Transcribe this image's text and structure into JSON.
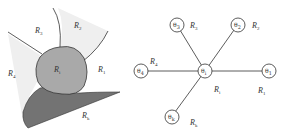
{
  "left_panel": {
    "regions": [
      {
        "id": "R1_center",
        "main": "R",
        "sub": "i",
        "fill": "#a9a9a9"
      },
      {
        "id": "R1",
        "main": "R",
        "sub": "1",
        "fill": "#ffffff"
      },
      {
        "id": "R2",
        "main": "R",
        "sub": "2",
        "fill": "#efefef"
      },
      {
        "id": "R3",
        "main": "R",
        "sub": "3",
        "fill": "#ffffff"
      },
      {
        "id": "R4",
        "main": "R",
        "sub": "4",
        "fill": "#efefef"
      },
      {
        "id": "Rk",
        "main": "R",
        "sub": "k",
        "fill": "#737373"
      }
    ]
  },
  "right_panel": {
    "center": {
      "main": "θ",
      "sub": "i",
      "label_main": "R",
      "label_sub": "i"
    },
    "nodes": [
      {
        "main": "θ",
        "sub": "3",
        "label_main": "R",
        "label_sub": "3"
      },
      {
        "main": "θ",
        "sub": "2",
        "label_main": "R",
        "label_sub": "2"
      },
      {
        "main": "θ",
        "sub": "4",
        "label_main": "R",
        "label_sub": "4"
      },
      {
        "main": "θ",
        "sub": "1",
        "label_main": "R",
        "label_sub": "1"
      },
      {
        "main": "θ",
        "sub": "k",
        "label_main": "R",
        "label_sub": "k"
      }
    ]
  }
}
